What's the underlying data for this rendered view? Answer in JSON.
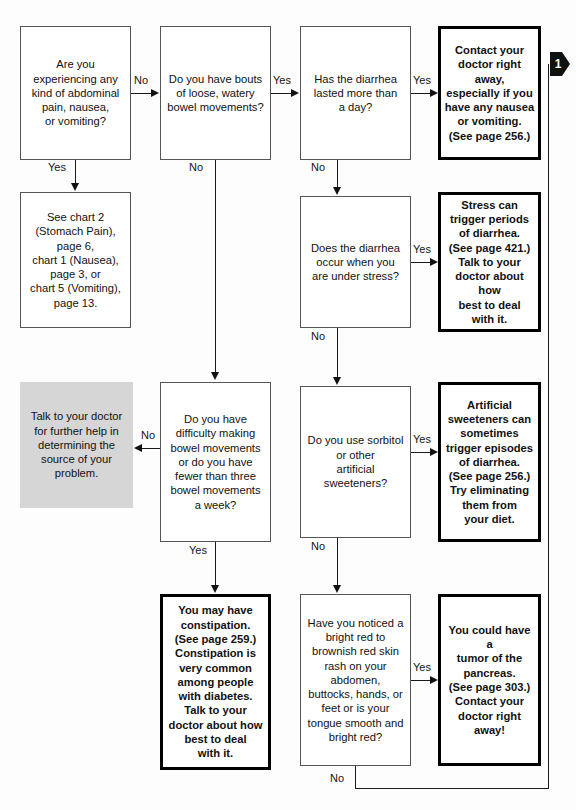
{
  "document": {
    "title": "Diarrhea / Constipation symptom flow chart"
  },
  "nodes": {
    "q_abdominal": "Are you\nexperiencing any\nkind of abdominal\npain, nausea,\nor vomiting?",
    "ref_charts": "See chart 2\n(Stomach Pain),\npage 6,\nchart 1 (Nausea),\npage 3, or\nchart 5 (Vomiting),\npage 13.",
    "q_loose_bowel": "Do you have bouts\nof loose, watery\nbowel movements?",
    "q_diarrhea_day": "Has the diarrhea\nlasted more than\na day?",
    "a_contact_doctor": "Contact your\ndoctor right away,\nespecially if you\nhave any nausea\nor vomiting.\n(See page 256.)",
    "q_stress": "Does the diarrhea\noccur when you\nare under stress?",
    "a_stress": "Stress can\ntrigger periods\nof diarrhea.\n(See page 421.)\nTalk to your\ndoctor about how\nbest to deal\nwith it.",
    "a_talk_doctor": "Talk to your doctor\nfor further help in\ndetermining the\nsource of your\nproblem.",
    "q_constipation": "Do you have\ndifficulty making\nbowel movements\nor do you have\nfewer than three\nbowel movements\na week?",
    "q_sorbitol": "Do you use sorbitol\nor other\nartificial\nsweeteners?",
    "a_sweeteners": "Artificial\nsweeteners can\nsometimes\ntrigger episodes\nof diarrhea.\n(See page 256.)\nTry eliminating\nthem from\nyour diet.",
    "a_constipation": "You may have\nconstipation.\n(See page 259.)\nConstipation is\nvery common\namong people\nwith diabetes.\nTalk to your\ndoctor about how\nbest to deal\nwith it.",
    "q_rash": "Have you noticed a\nbright red to\nbrownish red skin\nrash on your\nabdomen,\nbuttocks, hands, or\nfeet or is your\ntongue smooth and\nbright red?",
    "a_tumor": "You could have a\ntumor of the\npancreas.\n(See page 303.)\nContact your\ndoctor right away!"
  },
  "edge_labels": {
    "abdominal_no": "No",
    "abdominal_yes": "Yes",
    "loose_yes": "Yes",
    "loose_no": "No",
    "day_yes": "Yes",
    "day_no": "No",
    "stress_yes": "Yes",
    "stress_no": "No",
    "constipation_no": "No",
    "constipation_yes": "Yes",
    "sorbitol_yes": "Yes",
    "sorbitol_no": "No",
    "rash_yes": "Yes",
    "rash_no": "No"
  },
  "connector": {
    "label": "1"
  },
  "colors": {
    "shaded_box": "#d6d6d6",
    "line": "#1a1a1a",
    "answer_border": "#000000",
    "question_border": "#555555"
  }
}
